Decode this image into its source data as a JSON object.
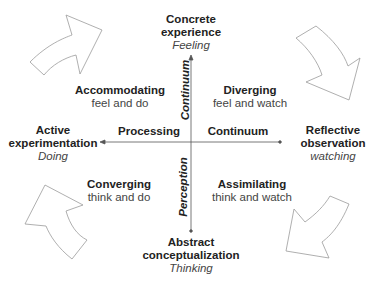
{
  "poles": {
    "top": {
      "title_1": "Concrete",
      "title_2": "experience",
      "sub": "Feeling"
    },
    "bottom": {
      "title_1": "Abstract",
      "title_2": "conceptualization",
      "sub": "Thinking"
    },
    "left": {
      "title_1": "Active",
      "title_2": "experimentation",
      "sub": "Doing"
    },
    "right": {
      "title_1": "Reflective",
      "title_2": "observation",
      "sub": "watching"
    }
  },
  "quadrants": {
    "top_left": {
      "title": "Accommodating",
      "sub": "feel and do"
    },
    "top_right": {
      "title": "Diverging",
      "sub": "feel and watch"
    },
    "bottom_left": {
      "title": "Converging",
      "sub": "think and do"
    },
    "bottom_right": {
      "title": "Assimilating",
      "sub": "think and watch"
    }
  },
  "axis_labels": {
    "horizontal_left": "Processing",
    "horizontal_right": "Continuum",
    "vertical_top": "Continuum",
    "vertical_bottom": "Perception"
  },
  "colors": {
    "axis": "#555555",
    "arrow_stroke": "#9a9a9a",
    "text": "#222222"
  }
}
